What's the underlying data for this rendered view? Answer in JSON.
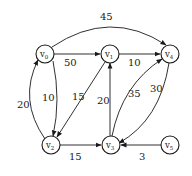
{
  "diagram": {
    "type": "weighted-directed-graph",
    "nodes": [
      {
        "id": "v0",
        "base": "v",
        "sub": "0",
        "x": 45,
        "y": 54
      },
      {
        "id": "v1",
        "base": "v",
        "sub": "1",
        "x": 110,
        "y": 54
      },
      {
        "id": "v4",
        "base": "v",
        "sub": "4",
        "x": 170,
        "y": 54
      },
      {
        "id": "v2",
        "base": "v",
        "sub": "2",
        "x": 51,
        "y": 145
      },
      {
        "id": "v3",
        "base": "v",
        "sub": "3",
        "x": 111,
        "y": 145
      },
      {
        "id": "v5",
        "base": "v",
        "sub": "5",
        "x": 170,
        "y": 145
      }
    ],
    "edges": [
      {
        "from": "v0",
        "to": "v4",
        "weight": "45"
      },
      {
        "from": "v0",
        "to": "v1",
        "weight": "50"
      },
      {
        "from": "v1",
        "to": "v4",
        "weight": "10"
      },
      {
        "from": "v0",
        "to": "v2",
        "weight": "10"
      },
      {
        "from": "v2",
        "to": "v0",
        "weight": "20"
      },
      {
        "from": "v1",
        "to": "v2",
        "weight": "15"
      },
      {
        "from": "v3",
        "to": "v1",
        "weight": "20"
      },
      {
        "from": "v3",
        "to": "v4",
        "weight": "35"
      },
      {
        "from": "v4",
        "to": "v3",
        "weight": "30"
      },
      {
        "from": "v2",
        "to": "v3",
        "weight": "15"
      },
      {
        "from": "v5",
        "to": "v3",
        "weight": "3"
      }
    ]
  }
}
